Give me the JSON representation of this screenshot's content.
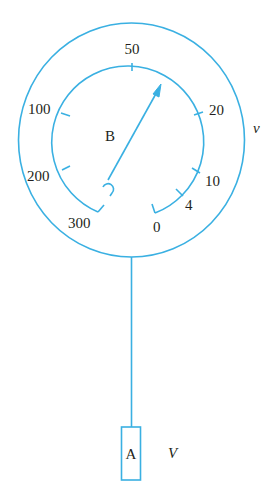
{
  "diagram": {
    "stroke_color": "#3ab0e2",
    "text_color": "#231f20",
    "dial": {
      "scale_labels": [
        "50",
        "20",
        "10",
        "4",
        "0",
        "100",
        "200",
        "300"
      ],
      "needle_label": "B",
      "outer_ring_label": "v"
    },
    "weight": {
      "label": "A",
      "side_label": "V"
    }
  }
}
